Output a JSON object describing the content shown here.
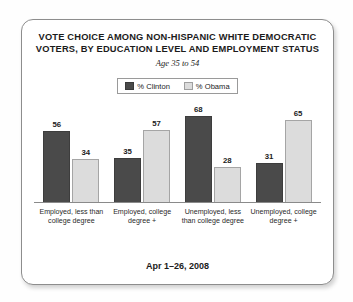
{
  "chart_data": {
    "type": "bar",
    "title_lines": [
      "VOTE CHOICE AMONG NON-HISPANIC WHITE DEMOCRATIC",
      "VOTERS, BY EDUCATION LEVEL AND EMPLOYMENT STATUS"
    ],
    "subtitle": "Age 35 to 54",
    "footer": "Apr 1–26, 2008",
    "categories": [
      "Employed, less than college degree",
      "Employed, college degree +",
      "Unemployed, less than college degree",
      "Unemployed, college degree +"
    ],
    "series": [
      {
        "name": "% Clinton",
        "color": "#4a4a4a",
        "values": [
          56,
          35,
          68,
          31
        ]
      },
      {
        "name": "% Obama",
        "color": "#dcdcdc",
        "values": [
          34,
          57,
          28,
          65
        ]
      }
    ],
    "xlabel": "",
    "ylabel": "",
    "ylim": [
      0,
      80
    ],
    "grid": false,
    "legend_position": "top-center",
    "value_labels": true
  }
}
